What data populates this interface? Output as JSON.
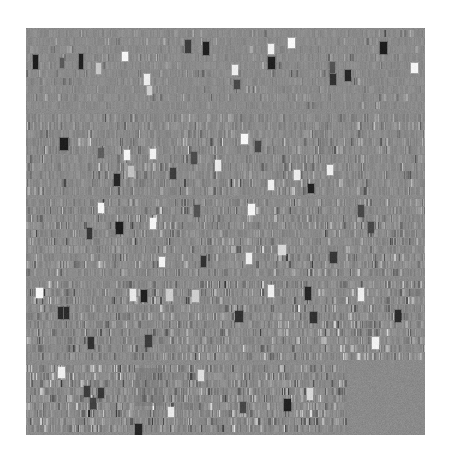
{
  "figure": {
    "type": "heatmap-matrix",
    "title": "",
    "background_color": "#ffffff",
    "plot_background_color": "#8a8a8a",
    "plot_rect": {
      "x": 26,
      "y": 28,
      "width": 399,
      "height": 407
    },
    "colormap": "gray",
    "value_range": [
      -1,
      1
    ],
    "axes_visible": false,
    "ticks_visible": false,
    "gridlines": false,
    "legend": false,
    "colorbar": false
  },
  "chart_data": {
    "type": "heatmap",
    "title": "",
    "xlabel": "",
    "ylabel": "",
    "colormap": "gray",
    "vmin": -1,
    "vmax": 1,
    "grid": false,
    "legend_position": "none",
    "n_bands": 5,
    "band_rows": 8,
    "cell_width_px": 3.6,
    "cell_height_px": 8.0,
    "subcell_bars": 3,
    "bands": [
      {
        "index": 0,
        "label": "band-1",
        "y_top": 28,
        "y_bottom": 112,
        "rows": 10,
        "columns": 111,
        "x_start": 26,
        "x_end": 425,
        "sparsity": 0.12,
        "noise_amplitude": 0.09,
        "base_value": 0.0
      },
      {
        "index": 1,
        "label": "band-2",
        "y_top": 112,
        "y_bottom": 197,
        "rows": 10,
        "columns": 111,
        "x_start": 26,
        "x_end": 425,
        "sparsity": 0.26,
        "noise_amplitude": 0.12,
        "base_value": 0.0
      },
      {
        "index": 2,
        "label": "band-3",
        "y_top": 197,
        "y_bottom": 279,
        "rows": 10,
        "columns": 111,
        "x_start": 26,
        "x_end": 425,
        "sparsity": 0.3,
        "noise_amplitude": 0.13,
        "base_value": 0.0
      },
      {
        "index": 3,
        "label": "band-4",
        "y_top": 279,
        "y_bottom": 363,
        "rows": 10,
        "columns": 111,
        "x_start": 26,
        "x_end": 425,
        "sparsity": 0.33,
        "noise_amplitude": 0.14,
        "base_value": 0.0
      },
      {
        "index": 4,
        "label": "band-5",
        "y_top": 363,
        "y_bottom": 435,
        "rows": 9,
        "columns": 89,
        "x_start": 26,
        "x_end": 345,
        "sparsity": 0.38,
        "noise_amplitude": 0.15,
        "base_value": 0.0
      }
    ],
    "highlight_blocks": [
      {
        "band": 0,
        "x": 33,
        "y": 55,
        "w": 5,
        "h": 14,
        "value": -0.98
      },
      {
        "band": 0,
        "x": 60,
        "y": 58,
        "w": 4,
        "h": 10,
        "value": -0.45
      },
      {
        "band": 0,
        "x": 79,
        "y": 54,
        "w": 4,
        "h": 15,
        "value": -0.95
      },
      {
        "band": 0,
        "x": 96,
        "y": 63,
        "w": 5,
        "h": 11,
        "value": 0.55
      },
      {
        "band": 0,
        "x": 122,
        "y": 52,
        "w": 6,
        "h": 9,
        "value": 0.96
      },
      {
        "band": 0,
        "x": 144,
        "y": 74,
        "w": 6,
        "h": 11,
        "value": 0.88
      },
      {
        "band": 0,
        "x": 147,
        "y": 86,
        "w": 5,
        "h": 9,
        "value": 0.6
      },
      {
        "band": 0,
        "x": 185,
        "y": 40,
        "w": 6,
        "h": 13,
        "value": -0.7
      },
      {
        "band": 0,
        "x": 203,
        "y": 42,
        "w": 6,
        "h": 13,
        "value": -0.95
      },
      {
        "band": 0,
        "x": 232,
        "y": 65,
        "w": 6,
        "h": 10,
        "value": 0.9
      },
      {
        "band": 0,
        "x": 234,
        "y": 80,
        "w": 6,
        "h": 9,
        "value": -0.6
      },
      {
        "band": 0,
        "x": 268,
        "y": 44,
        "w": 6,
        "h": 10,
        "value": 0.9
      },
      {
        "band": 0,
        "x": 268,
        "y": 57,
        "w": 7,
        "h": 12,
        "value": -0.95
      },
      {
        "band": 0,
        "x": 288,
        "y": 38,
        "w": 7,
        "h": 10,
        "value": 1.0
      },
      {
        "band": 0,
        "x": 330,
        "y": 62,
        "w": 5,
        "h": 11,
        "value": -0.5
      },
      {
        "band": 0,
        "x": 330,
        "y": 74,
        "w": 6,
        "h": 11,
        "value": -0.8
      },
      {
        "band": 0,
        "x": 345,
        "y": 70,
        "w": 6,
        "h": 11,
        "value": -0.9
      },
      {
        "band": 0,
        "x": 380,
        "y": 42,
        "w": 7,
        "h": 12,
        "value": -0.98
      },
      {
        "band": 0,
        "x": 411,
        "y": 63,
        "w": 7,
        "h": 10,
        "value": 0.95
      },
      {
        "band": 1,
        "x": 60,
        "y": 138,
        "w": 8,
        "h": 12,
        "value": -0.98
      },
      {
        "band": 1,
        "x": 98,
        "y": 148,
        "w": 6,
        "h": 10,
        "value": -0.4
      },
      {
        "band": 1,
        "x": 124,
        "y": 150,
        "w": 6,
        "h": 10,
        "value": 0.95
      },
      {
        "band": 1,
        "x": 150,
        "y": 149,
        "w": 6,
        "h": 10,
        "value": 0.92
      },
      {
        "band": 1,
        "x": 128,
        "y": 166,
        "w": 6,
        "h": 11,
        "value": 0.5
      },
      {
        "band": 1,
        "x": 114,
        "y": 174,
        "w": 6,
        "h": 12,
        "value": -0.9
      },
      {
        "band": 1,
        "x": 170,
        "y": 168,
        "w": 6,
        "h": 11,
        "value": -0.7
      },
      {
        "band": 1,
        "x": 191,
        "y": 152,
        "w": 6,
        "h": 12,
        "value": -0.55
      },
      {
        "band": 1,
        "x": 215,
        "y": 160,
        "w": 6,
        "h": 11,
        "value": 0.85
      },
      {
        "band": 1,
        "x": 241,
        "y": 134,
        "w": 7,
        "h": 10,
        "value": 0.98
      },
      {
        "band": 1,
        "x": 255,
        "y": 141,
        "w": 6,
        "h": 11,
        "value": -0.6
      },
      {
        "band": 1,
        "x": 268,
        "y": 180,
        "w": 6,
        "h": 10,
        "value": 0.9
      },
      {
        "band": 1,
        "x": 294,
        "y": 170,
        "w": 6,
        "h": 10,
        "value": 0.88
      },
      {
        "band": 1,
        "x": 308,
        "y": 184,
        "w": 6,
        "h": 9,
        "value": -0.95
      },
      {
        "band": 1,
        "x": 327,
        "y": 165,
        "w": 6,
        "h": 10,
        "value": 0.9
      },
      {
        "band": 2,
        "x": 98,
        "y": 203,
        "w": 6,
        "h": 10,
        "value": 0.95
      },
      {
        "band": 2,
        "x": 116,
        "y": 222,
        "w": 7,
        "h": 12,
        "value": -0.98
      },
      {
        "band": 2,
        "x": 87,
        "y": 228,
        "w": 5,
        "h": 11,
        "value": -0.75
      },
      {
        "band": 2,
        "x": 150,
        "y": 218,
        "w": 6,
        "h": 11,
        "value": 0.96
      },
      {
        "band": 2,
        "x": 159,
        "y": 257,
        "w": 6,
        "h": 10,
        "value": 0.95
      },
      {
        "band": 2,
        "x": 194,
        "y": 205,
        "w": 6,
        "h": 12,
        "value": -0.5
      },
      {
        "band": 2,
        "x": 201,
        "y": 256,
        "w": 5,
        "h": 11,
        "value": -0.8
      },
      {
        "band": 2,
        "x": 248,
        "y": 204,
        "w": 7,
        "h": 11,
        "value": 0.95
      },
      {
        "band": 2,
        "x": 246,
        "y": 253,
        "w": 6,
        "h": 11,
        "value": 0.9
      },
      {
        "band": 2,
        "x": 278,
        "y": 245,
        "w": 8,
        "h": 10,
        "value": 0.7
      },
      {
        "band": 2,
        "x": 330,
        "y": 252,
        "w": 7,
        "h": 11,
        "value": -0.75
      },
      {
        "band": 2,
        "x": 358,
        "y": 205,
        "w": 6,
        "h": 12,
        "value": -0.6
      },
      {
        "band": 2,
        "x": 368,
        "y": 222,
        "w": 6,
        "h": 11,
        "value": -0.6
      },
      {
        "band": 3,
        "x": 36,
        "y": 288,
        "w": 7,
        "h": 10,
        "value": 0.98
      },
      {
        "band": 3,
        "x": 58,
        "y": 307,
        "w": 5,
        "h": 12,
        "value": -0.85
      },
      {
        "band": 3,
        "x": 64,
        "y": 307,
        "w": 5,
        "h": 12,
        "value": -0.85
      },
      {
        "band": 3,
        "x": 88,
        "y": 337,
        "w": 6,
        "h": 12,
        "value": -0.8
      },
      {
        "band": 3,
        "x": 130,
        "y": 289,
        "w": 6,
        "h": 12,
        "value": 0.85
      },
      {
        "band": 3,
        "x": 141,
        "y": 290,
        "w": 6,
        "h": 12,
        "value": -0.95
      },
      {
        "band": 3,
        "x": 166,
        "y": 289,
        "w": 7,
        "h": 12,
        "value": 0.6
      },
      {
        "band": 3,
        "x": 145,
        "y": 335,
        "w": 7,
        "h": 12,
        "value": -0.7
      },
      {
        "band": 3,
        "x": 192,
        "y": 290,
        "w": 7,
        "h": 12,
        "value": 0.6
      },
      {
        "band": 3,
        "x": 235,
        "y": 311,
        "w": 8,
        "h": 11,
        "value": -0.8
      },
      {
        "band": 3,
        "x": 268,
        "y": 285,
        "w": 6,
        "h": 12,
        "value": 0.9
      },
      {
        "band": 3,
        "x": 305,
        "y": 287,
        "w": 6,
        "h": 13,
        "value": -0.9
      },
      {
        "band": 3,
        "x": 310,
        "y": 312,
        "w": 7,
        "h": 11,
        "value": -0.8
      },
      {
        "band": 3,
        "x": 358,
        "y": 288,
        "w": 6,
        "h": 13,
        "value": 0.9
      },
      {
        "band": 3,
        "x": 372,
        "y": 337,
        "w": 7,
        "h": 12,
        "value": 0.92
      },
      {
        "band": 3,
        "x": 395,
        "y": 310,
        "w": 6,
        "h": 12,
        "value": -0.85
      },
      {
        "band": 4,
        "x": 58,
        "y": 367,
        "w": 7,
        "h": 11,
        "value": 0.9
      },
      {
        "band": 4,
        "x": 84,
        "y": 386,
        "w": 6,
        "h": 11,
        "value": -0.7
      },
      {
        "band": 4,
        "x": 90,
        "y": 398,
        "w": 6,
        "h": 11,
        "value": -0.65
      },
      {
        "band": 4,
        "x": 98,
        "y": 388,
        "w": 6,
        "h": 10,
        "value": -0.75
      },
      {
        "band": 4,
        "x": 135,
        "y": 424,
        "w": 7,
        "h": 11,
        "value": -0.9
      },
      {
        "band": 4,
        "x": 168,
        "y": 407,
        "w": 6,
        "h": 10,
        "value": 0.85
      },
      {
        "band": 4,
        "x": 198,
        "y": 370,
        "w": 6,
        "h": 11,
        "value": 0.75
      },
      {
        "band": 4,
        "x": 240,
        "y": 402,
        "w": 6,
        "h": 11,
        "value": -0.6
      },
      {
        "band": 4,
        "x": 284,
        "y": 399,
        "w": 7,
        "h": 12,
        "value": -0.95
      },
      {
        "band": 4,
        "x": 307,
        "y": 388,
        "w": 6,
        "h": 12,
        "value": 0.7
      }
    ],
    "dark_patch": {
      "x": 135,
      "y": 368,
      "width": 28,
      "height": 38,
      "value": -0.22,
      "label": "dark-rectangular-patch"
    }
  },
  "accessibility": {
    "alt": "Grayscale matrix visualization with five horizontal bands of small cells; most cells mid-gray with scattered bright white and black blocks"
  }
}
